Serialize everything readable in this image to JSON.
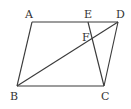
{
  "diagram": {
    "type": "parallelogram",
    "points": {
      "A": {
        "label": "A",
        "x": 32,
        "y": 22,
        "lx": 25,
        "ly": 18
      },
      "E": {
        "label": "E",
        "x": 88,
        "y": 22,
        "lx": 84,
        "ly": 18
      },
      "D": {
        "label": "D",
        "x": 118,
        "y": 22,
        "lx": 117,
        "ly": 18
      },
      "F": {
        "label": "F",
        "x": 92,
        "y": 38,
        "lx": 82,
        "ly": 41
      },
      "B": {
        "label": "B",
        "x": 17,
        "y": 86,
        "lx": 11,
        "ly": 100
      },
      "C": {
        "label": "C",
        "x": 104,
        "y": 86,
        "lx": 101,
        "ly": 100
      }
    },
    "segments": [
      [
        "A",
        "D"
      ],
      [
        "A",
        "B"
      ],
      [
        "B",
        "C"
      ],
      [
        "C",
        "D"
      ],
      [
        "B",
        "D"
      ],
      [
        "E",
        "C"
      ]
    ]
  }
}
